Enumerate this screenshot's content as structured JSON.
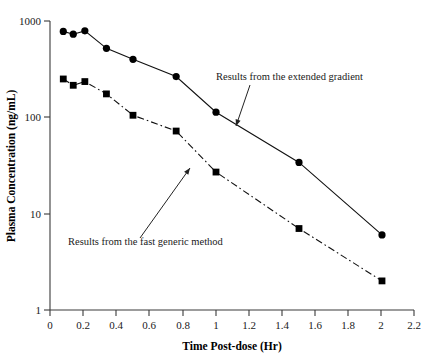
{
  "chart_data": {
    "type": "line",
    "title": "",
    "xlabel": "Time Post-dose (Hr)",
    "ylabel": "Plasma Concentration (ng/mL)",
    "xlim": [
      0,
      2.2
    ],
    "ylim": [
      1,
      1000
    ],
    "yscale": "log",
    "grid": false,
    "legend": "none",
    "xticks": [
      "0",
      "0.2",
      "0.4",
      "0.6",
      "0.8",
      "1",
      "1.2",
      "1.4",
      "1.6",
      "1.8",
      "2",
      "2.2"
    ],
    "xtick_values": [
      0,
      0.2,
      0.4,
      0.6,
      0.8,
      1.0,
      1.2,
      1.4,
      1.6,
      1.8,
      2.0,
      2.2
    ],
    "yticks": [
      "1",
      "10",
      "100",
      "1000"
    ],
    "ytick_values": [
      1,
      10,
      100,
      1000
    ],
    "series": [
      {
        "name": "Results from the extended gradient",
        "marker": "circle",
        "linestyle": "solid",
        "color": "#000000",
        "x": [
          0.08,
          0.14,
          0.21,
          0.34,
          0.5,
          0.76,
          1.0,
          1.5,
          2.0
        ],
        "values": [
          780,
          730,
          790,
          520,
          400,
          265,
          113,
          34,
          6
        ]
      },
      {
        "name": "Results from the fast generic method",
        "marker": "square",
        "linestyle": "dashdot",
        "color": "#000000",
        "x": [
          0.08,
          0.14,
          0.21,
          0.34,
          0.5,
          0.76,
          1.0,
          1.5,
          2.0
        ],
        "values": [
          250,
          215,
          235,
          175,
          105,
          72,
          27,
          7,
          2
        ]
      }
    ],
    "annotations": [
      {
        "text": "Results from the extended gradient",
        "text_x": 216,
        "text_y": 80,
        "arrow_from": [
          250,
          85
        ],
        "arrow_to": [
          236,
          126
        ]
      },
      {
        "text": "Results from the fast generic method",
        "text_x": 68,
        "text_y": 245,
        "arrow_from": [
          140,
          238
        ],
        "arrow_to": [
          190,
          168
        ]
      }
    ]
  }
}
